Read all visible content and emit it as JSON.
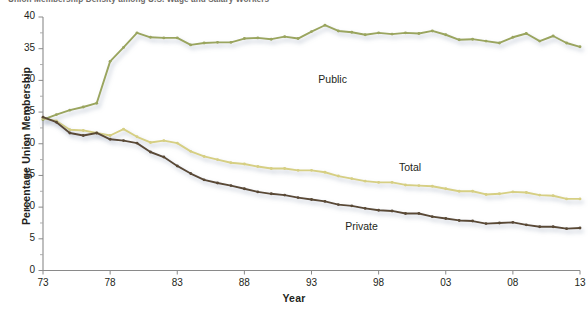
{
  "chart_data": {
    "type": "line",
    "title": "Union Membership Density among U.S. Wage and Salary Workers",
    "xlabel": "Year",
    "ylabel": "Percentage Union Membership",
    "xlim": [
      1973,
      2013
    ],
    "ylim": [
      0,
      40
    ],
    "grid": false,
    "legend_position": "inline-annotations",
    "y_ticks": [
      0,
      5,
      10,
      15,
      20,
      25,
      30,
      35,
      40
    ],
    "y_tick_labels": [
      "0",
      "5",
      "10",
      "15",
      "20",
      "25",
      "30",
      "35",
      "40"
    ],
    "y_minor_ticks": [
      2.5,
      7.5,
      12.5,
      17.5,
      22.5,
      27.5,
      32.5,
      37.5
    ],
    "x_ticks": [
      1973,
      1978,
      1983,
      1988,
      1993,
      1998,
      2003,
      2008,
      2013
    ],
    "x_tick_labels": [
      "73",
      "78",
      "83",
      "88",
      "93",
      "98",
      "03",
      "08",
      "13"
    ],
    "x": [
      1973,
      1974,
      1975,
      1976,
      1977,
      1978,
      1979,
      1980,
      1981,
      1982,
      1983,
      1984,
      1985,
      1986,
      1987,
      1988,
      1989,
      1990,
      1991,
      1992,
      1993,
      1994,
      1995,
      1996,
      1997,
      1998,
      1999,
      2000,
      2001,
      2002,
      2003,
      2004,
      2005,
      2006,
      2007,
      2008,
      2009,
      2010,
      2011,
      2012,
      2013
    ],
    "series": [
      {
        "name": "Public",
        "color": "#9aa55e",
        "values": [
          23.8,
          24.6,
          25.3,
          25.8,
          26.4,
          33.0,
          35.2,
          37.5,
          36.8,
          36.7,
          36.7,
          35.6,
          35.9,
          36.0,
          36.0,
          36.6,
          36.7,
          36.5,
          36.9,
          36.6,
          37.7,
          38.7,
          37.8,
          37.6,
          37.2,
          37.5,
          37.3,
          37.5,
          37.4,
          37.8,
          37.2,
          36.4,
          36.5,
          36.2,
          35.9,
          36.8,
          37.4,
          36.2,
          37.0,
          35.9,
          35.3
        ]
      },
      {
        "name": "Total",
        "color": "#d6cf83",
        "values": [
          24.0,
          23.6,
          22.2,
          22.1,
          21.7,
          21.3,
          22.3,
          21.1,
          20.2,
          20.5,
          20.1,
          18.8,
          18.0,
          17.5,
          17.0,
          16.8,
          16.4,
          16.1,
          16.1,
          15.8,
          15.8,
          15.5,
          14.9,
          14.5,
          14.1,
          13.9,
          13.9,
          13.5,
          13.4,
          13.3,
          12.9,
          12.5,
          12.5,
          12.0,
          12.1,
          12.4,
          12.3,
          11.9,
          11.8,
          11.3,
          11.3
        ]
      },
      {
        "name": "Private",
        "color": "#5a4a36",
        "values": [
          24.2,
          23.4,
          21.7,
          21.3,
          21.7,
          20.7,
          20.5,
          20.1,
          18.7,
          17.9,
          16.5,
          15.3,
          14.3,
          13.8,
          13.4,
          12.9,
          12.4,
          12.1,
          11.9,
          11.5,
          11.2,
          10.9,
          10.4,
          10.2,
          9.8,
          9.5,
          9.4,
          9.0,
          9.0,
          8.5,
          8.2,
          7.9,
          7.8,
          7.4,
          7.5,
          7.6,
          7.2,
          6.9,
          6.9,
          6.6,
          6.7
        ]
      }
    ],
    "annotations": [
      {
        "text": "Public",
        "x": 1995,
        "y": 30.0
      },
      {
        "text": "Total",
        "x": 2001,
        "y": 16.2
      },
      {
        "text": "Private",
        "x": 1997,
        "y": 6.9
      }
    ]
  }
}
